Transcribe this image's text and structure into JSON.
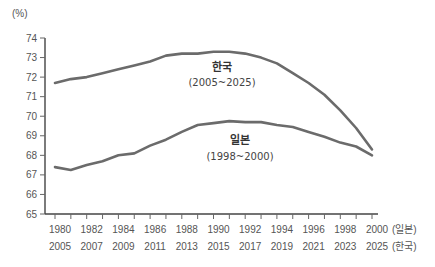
{
  "chart_data": {
    "type": "line",
    "title": "",
    "ylabel": "(%)",
    "xlabel": "",
    "ylim": [
      65,
      74
    ],
    "yticks": [
      65,
      66,
      67,
      68,
      69,
      70,
      71,
      72,
      73,
      74
    ],
    "grid": false,
    "legend": "inline annotations",
    "x_axis_rows": [
      {
        "suffix": "(일본)",
        "ticks": [
          "1980",
          "1982",
          "1984",
          "1986",
          "1988",
          "1990",
          "1992",
          "1994",
          "1996",
          "1998",
          "2000"
        ]
      },
      {
        "suffix": "(한국)",
        "ticks": [
          "2005",
          "2007",
          "2009",
          "2011",
          "2013",
          "2015",
          "2017",
          "2019",
          "2021",
          "2023",
          "2025"
        ]
      }
    ],
    "x_index": [
      0,
      1,
      2,
      3,
      4,
      5,
      6,
      7,
      8,
      9,
      10,
      11,
      12,
      13,
      14,
      15,
      16,
      17,
      18,
      19,
      20
    ],
    "series": [
      {
        "name": "한국",
        "period": "(2005~2025)",
        "values": [
          71.7,
          71.9,
          72.0,
          72.2,
          72.4,
          72.6,
          72.8,
          73.1,
          73.2,
          73.2,
          73.3,
          73.3,
          73.2,
          73.0,
          72.7,
          72.2,
          71.7,
          71.1,
          70.3,
          69.4,
          68.3
        ]
      },
      {
        "name": "일본",
        "period": "(1998~2000)",
        "values": [
          67.4,
          67.25,
          67.5,
          67.7,
          68.0,
          68.1,
          68.5,
          68.8,
          69.2,
          69.55,
          69.65,
          69.75,
          69.7,
          69.7,
          69.55,
          69.45,
          69.2,
          68.95,
          68.65,
          68.45,
          68.0
        ]
      }
    ]
  },
  "labels": {
    "y_unit": "(%)",
    "korea_name": "한국",
    "korea_period": "(2005~2025)",
    "japan_name": "일본",
    "japan_period": "(1998~2000)",
    "row1_suffix": "(일본)",
    "row2_suffix": "(한국)"
  }
}
